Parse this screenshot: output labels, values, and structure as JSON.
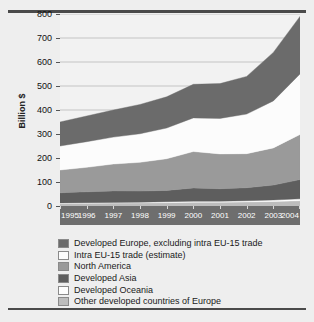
{
  "chart_data": {
    "type": "area",
    "stacked": true,
    "title": "",
    "xlabel": "",
    "ylabel": "Billion $",
    "categories": [
      "1995",
      "1996",
      "1997",
      "1998",
      "1999",
      "2000",
      "2001",
      "2002",
      "2003",
      "2004"
    ],
    "x": [
      1995,
      1996,
      1997,
      1998,
      1999,
      2000,
      2001,
      2002,
      2003,
      2004
    ],
    "ylim": [
      0,
      800
    ],
    "yticks": [
      0,
      100,
      200,
      300,
      400,
      500,
      600,
      700,
      800
    ],
    "grid": true,
    "legend_position": "bottom",
    "series": [
      {
        "name": "Other developed countries of Europe",
        "color": "#bdbdbd",
        "values": [
          10,
          11,
          12,
          13,
          14,
          16,
          16,
          17,
          19,
          22
        ]
      },
      {
        "name": "Developed Oceania",
        "color": "#fdfdfd",
        "values": [
          3,
          3,
          3,
          3,
          4,
          4,
          4,
          5,
          6,
          8
        ]
      },
      {
        "name": "Developed Asia",
        "color": "#5e5e5e",
        "values": [
          42,
          45,
          48,
          46,
          47,
          55,
          52,
          54,
          62,
          80
        ]
      },
      {
        "name": "North America",
        "color": "#9a9a9a",
        "values": [
          95,
          102,
          112,
          120,
          132,
          152,
          145,
          142,
          155,
          188
        ]
      },
      {
        "name": "Intra EU-15 trade (estimate)",
        "color": "#fcfcfc",
        "values": [
          100,
          107,
          112,
          119,
          128,
          140,
          148,
          165,
          196,
          252
        ]
      },
      {
        "name": "Developed Europe, excluding intra EU-15 trade",
        "color": "#6b6b6b",
        "values": [
          100,
          107,
          113,
          122,
          130,
          140,
          145,
          157,
          202,
          240
        ]
      }
    ],
    "cumulative_top": [
      350,
      375,
      400,
      423,
      455,
      507,
      510,
      540,
      640,
      790
    ]
  },
  "axis": {
    "ylabel": "Billion $",
    "yticks": [
      "800",
      "700",
      "600",
      "500",
      "400",
      "300",
      "200",
      "100",
      "0"
    ],
    "xticks": [
      "1995",
      "1996",
      "1997",
      "1998",
      "1999",
      "2000",
      "2001",
      "2002",
      "2003",
      "2004"
    ]
  },
  "legend": {
    "items": [
      {
        "label": "Developed Europe, excluding intra EU-15 trade",
        "color": "#6b6b6b"
      },
      {
        "label": "Intra EU-15 trade (estimate)",
        "color": "#fcfcfc"
      },
      {
        "label": "North America",
        "color": "#9a9a9a"
      },
      {
        "label": "Developed Asia",
        "color": "#5e5e5e"
      },
      {
        "label": "Developed Oceania",
        "color": "#fdfdfd"
      },
      {
        "label": "Other developed countries of Europe",
        "color": "#bdbdbd"
      }
    ]
  },
  "colors": {
    "page_background": "#eeeeee",
    "plot_background": "#f2f2f2",
    "axis_band": "#6e6e6e",
    "rule": "#4a4a4a",
    "gridline": "#b9b9b9"
  }
}
